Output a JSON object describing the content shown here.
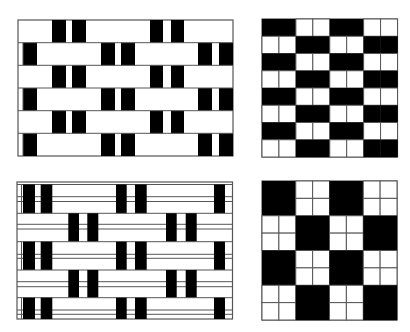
{
  "colors": {
    "black": "#000000",
    "white": "#ffffff",
    "line": "#555555"
  },
  "patterns": [
    {
      "id": "plain-weave-bars",
      "position": "top-left",
      "bounds": {
        "x": 18,
        "y": 20,
        "w": 215,
        "h": 136
      },
      "rows": [
        {
          "y": 20,
          "h": 22.7,
          "blacks": [
            [
              52,
              66
            ],
            [
              72,
              86
            ],
            [
              150,
              163
            ],
            [
              171,
              184
            ]
          ]
        },
        {
          "y": 42.7,
          "h": 22.7,
          "blacks": [
            [
              23,
              37
            ],
            [
              101,
              115
            ],
            [
              121,
              135
            ],
            [
              198,
              212
            ],
            [
              219,
              233
            ]
          ]
        },
        {
          "y": 65.3,
          "h": 22.7,
          "blacks": [
            [
              52,
              66
            ],
            [
              72,
              86
            ],
            [
              150,
              163
            ],
            [
              171,
              184
            ]
          ]
        },
        {
          "y": 88,
          "h": 22.7,
          "blacks": [
            [
              23,
              37
            ],
            [
              101,
              115
            ],
            [
              121,
              135
            ],
            [
              198,
              212
            ],
            [
              219,
              233
            ]
          ]
        },
        {
          "y": 110.7,
          "h": 22.7,
          "blacks": [
            [
              52,
              66
            ],
            [
              72,
              86
            ],
            [
              150,
              163
            ],
            [
              171,
              184
            ]
          ]
        },
        {
          "y": 133.3,
          "h": 22.7,
          "blacks": [
            [
              23,
              37
            ],
            [
              101,
              115
            ],
            [
              121,
              135
            ],
            [
              198,
              212
            ],
            [
              219,
              233
            ]
          ]
        }
      ],
      "vertical_lines": [
        23
      ]
    },
    {
      "id": "checker-8x8",
      "position": "top-right",
      "bounds": {
        "x": 262,
        "y": 19,
        "w": 135.5,
        "h": 138
      },
      "cols": 8,
      "rows": 8,
      "block": 2
    },
    {
      "id": "striped-weave-bars",
      "position": "bottom-left",
      "bounds": {
        "x": 17,
        "y": 182,
        "w": 215.5,
        "h": 137
      },
      "inner_top": 184.5,
      "inner_left": 21.5,
      "rows": [
        {
          "y": 184.5,
          "h": 28.8,
          "lines": [
            196.7,
            201.5
          ],
          "blacks": [
            [
              23,
              35
            ],
            [
              40.7,
              52.3
            ],
            [
              116,
              126.7
            ],
            [
              135,
              146.7
            ],
            [
              214,
              225
            ]
          ]
        },
        {
          "y": 213.3,
          "h": 28.4,
          "lines": [
            224.3,
            229
          ],
          "blacks": [
            [
              68.3,
              79
            ],
            [
              87.3,
              98.3
            ],
            [
              166,
              176.7
            ],
            [
              185.7,
              196.7
            ]
          ]
        },
        {
          "y": 241.7,
          "h": 28.3,
          "lines": [
            254.3,
            258.3
          ],
          "blacks": [
            [
              23,
              35
            ],
            [
              40.7,
              52.3
            ],
            [
              116,
              126.7
            ],
            [
              135,
              146.7
            ],
            [
              214,
              225
            ]
          ]
        },
        {
          "y": 270,
          "h": 27.7,
          "lines": [
            281.7,
            286.7
          ],
          "blacks": [
            [
              68.3,
              79
            ],
            [
              87.3,
              98.3
            ],
            [
              166,
              176.7
            ],
            [
              185.7,
              196.7
            ]
          ]
        },
        {
          "y": 297.7,
          "h": 21.3,
          "lines": [
            310,
            314.3
          ],
          "blacks": [
            [
              23,
              35
            ],
            [
              40.7,
              52.3
            ],
            [
              116,
              126.7
            ],
            [
              135,
              146.7
            ],
            [
              214,
              225
            ]
          ]
        }
      ]
    },
    {
      "id": "checker-4x4-subdivided",
      "position": "bottom-right",
      "bounds": {
        "x": 262,
        "y": 181,
        "w": 135,
        "h": 139
      },
      "cols": 4,
      "rows": 4,
      "subdivide_white": 2
    }
  ]
}
